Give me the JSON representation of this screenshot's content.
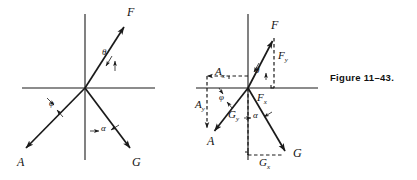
{
  "figure": {
    "caption": "Figure  11–43.",
    "ink_color": "#1a1a1a",
    "background_color": "#ffffff"
  },
  "diagram_left": {
    "name": "vector-diagram-left",
    "origin": {
      "x": 85,
      "y": 88
    },
    "axes": {
      "x_axis": {
        "x1": 22,
        "y1": 88,
        "x2": 155,
        "y2": 88
      },
      "y_axis": {
        "x1": 85,
        "y1": 14,
        "x2": 85,
        "y2": 160
      }
    },
    "vectors": [
      {
        "label": "F",
        "from": {
          "x": 85,
          "y": 88
        },
        "to": {
          "x": 126,
          "y": 24
        },
        "label_pos": {
          "x": 127,
          "y": 8
        }
      },
      {
        "label": "A",
        "from": {
          "x": 85,
          "y": 88
        },
        "to": {
          "x": 23,
          "y": 151
        },
        "label_pos": {
          "x": 18,
          "y": 158
        }
      },
      {
        "label": "G",
        "from": {
          "x": 85,
          "y": 88
        },
        "to": {
          "x": 134,
          "y": 152
        },
        "label_pos": {
          "x": 133,
          "y": 158
        }
      }
    ],
    "angles": [
      {
        "label": "θ",
        "pos": {
          "x": 105,
          "y": 52
        }
      },
      {
        "label": "φ",
        "pos": {
          "x": 52,
          "y": 104
        }
      },
      {
        "label": "α",
        "pos": {
          "x": 104,
          "y": 128
        }
      }
    ]
  },
  "diagram_right": {
    "name": "vector-diagram-right",
    "origin": {
      "x": 248,
      "y": 88
    },
    "axes": {
      "x_axis": {
        "x1": 196,
        "y1": 88,
        "x2": 318,
        "y2": 88
      },
      "y_axis": {
        "x1": 248,
        "y1": 14,
        "x2": 248,
        "y2": 160
      }
    },
    "vectors": [
      {
        "label": "F",
        "from": {
          "x": 248,
          "y": 88
        },
        "to": {
          "x": 274,
          "y": 38
        },
        "label_pos": {
          "x": 272,
          "y": 21
        }
      },
      {
        "label": "A",
        "from": {
          "x": 248,
          "y": 88
        },
        "to": {
          "x": 212,
          "y": 134
        },
        "label_pos": {
          "x": 208,
          "y": 138
        }
      },
      {
        "label": "G",
        "from": {
          "x": 248,
          "y": 88
        },
        "to": {
          "x": 288,
          "y": 155
        },
        "label_pos": {
          "x": 294,
          "y": 150
        }
      }
    ],
    "components": [
      {
        "label": "Fy",
        "base": "F",
        "sub": "y",
        "pos": {
          "x": 278,
          "y": 55
        }
      },
      {
        "label": "Fx",
        "base": "F",
        "sub": "x",
        "pos": {
          "x": 258,
          "y": 93
        }
      },
      {
        "label": "Ax",
        "base": "A",
        "sub": "x",
        "pos": {
          "x": 216,
          "y": 71
        }
      },
      {
        "label": "Ay",
        "base": "A",
        "sub": "y",
        "pos": {
          "x": 196,
          "y": 104
        }
      },
      {
        "label": "Gy",
        "base": "G",
        "sub": "y",
        "pos": {
          "x": 229,
          "y": 114
        }
      },
      {
        "label": "Gx",
        "base": "G",
        "sub": "x",
        "pos": {
          "x": 260,
          "y": 161
        }
      }
    ],
    "angles": [
      {
        "label": "θ",
        "pos": {
          "x": 257,
          "y": 70
        }
      },
      {
        "label": "φ",
        "pos": {
          "x": 221,
          "y": 98
        }
      },
      {
        "label": "α",
        "pos": {
          "x": 256,
          "y": 115
        }
      }
    ]
  }
}
